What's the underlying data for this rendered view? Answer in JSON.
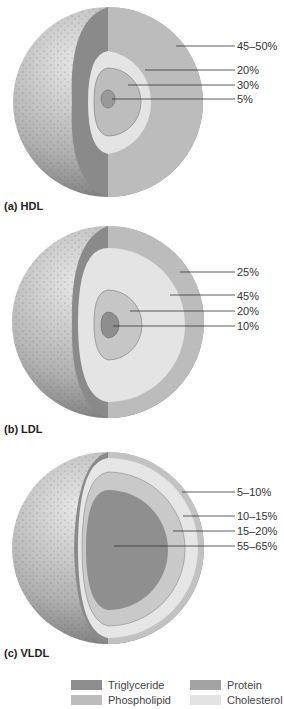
{
  "colors": {
    "triglyceride": "#8e8e8e",
    "protein": "#a3a3a3",
    "phospholipid": "#bcbcbc",
    "cholesterol": "#e3e3e3",
    "surface": "#b5b5b5",
    "cut_face_dark": "#7d7d7d"
  },
  "panels": [
    {
      "caption": "(a)  HDL",
      "labels": [
        "45–50%",
        "20%",
        "30%",
        "5%"
      ]
    },
    {
      "caption": "(b)  LDL",
      "labels": [
        "25%",
        "45%",
        "20%",
        "10%"
      ]
    },
    {
      "caption": "(c)  VLDL",
      "labels": [
        "5–10%",
        "10–15%",
        "15–20%",
        "55–65%"
      ]
    }
  ],
  "legend": [
    {
      "label": "Triglyceride",
      "component": "triglyceride"
    },
    {
      "label": "Protein",
      "component": "protein"
    },
    {
      "label": "Phospholipid",
      "component": "phospholipid"
    },
    {
      "label": "Cholesterol",
      "component": "cholesterol"
    }
  ]
}
